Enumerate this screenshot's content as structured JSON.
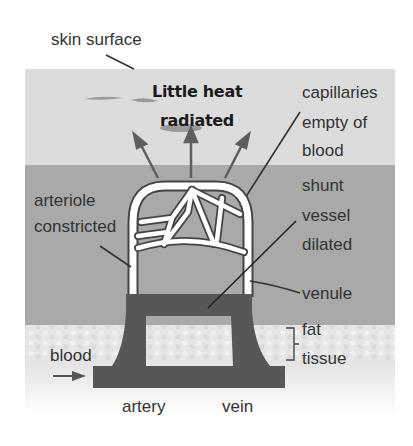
{
  "diagram": {
    "colors": {
      "epidermis": "#dcdcdc",
      "dermis": "#a9a9a9",
      "fat": "#e4e4e4",
      "vessel": "#575757",
      "capillary": "#ffffff",
      "arrow": "#5e5e5e",
      "label": "#333333"
    },
    "labels": {
      "skin_surface": "skin surface",
      "heat_line1": "Little heat",
      "heat_line2": "radiated",
      "capillaries_line1": "capillaries",
      "capillaries_line2": "empty of",
      "capillaries_line3": "blood",
      "shunt_line1": "shunt",
      "shunt_line2": "vessel",
      "shunt_line3": "dilated",
      "arteriole_line1": "arteriole",
      "arteriole_line2": "constricted",
      "venule": "venule",
      "fat_line1": "fat",
      "fat_line2": "tissue",
      "blood": "blood",
      "artery": "artery",
      "vein": "vein"
    },
    "heat_arrows": [
      "left",
      "up",
      "right"
    ],
    "blood_flow_arrow": "right"
  }
}
